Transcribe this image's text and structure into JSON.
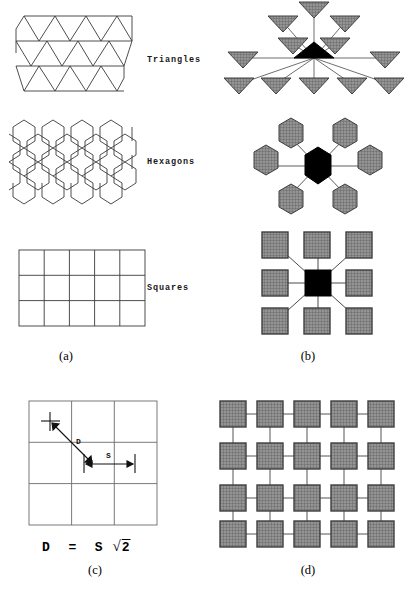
{
  "figure": {
    "kind": "tessellation-neighborhood-diagram",
    "panels": [
      {
        "id": "a",
        "caption": "(a)",
        "description": "tessellation tilings"
      },
      {
        "id": "b",
        "caption": "(b)",
        "description": "cell neighborhoods"
      },
      {
        "id": "c",
        "caption": "(c)",
        "description": "diagonal distance in square grid"
      },
      {
        "id": "d",
        "caption": "(d)",
        "description": "square lattice connectivity"
      }
    ]
  },
  "tilings": {
    "triangles": {
      "label": "Triangles",
      "cols": 4,
      "rows": 3,
      "cell_width": 31,
      "cell_height": 25
    },
    "hexagons": {
      "label": "Hexagons",
      "cols": 4,
      "rows": 3,
      "cell_width": 29,
      "cell_height": 28
    },
    "squares": {
      "label": "Squares",
      "cols": 5,
      "rows": 3,
      "cell_width": 25,
      "cell_height": 25
    }
  },
  "neighborhoods": {
    "triangles": {
      "center_shape": "triangle-up",
      "center_fill": "#000000",
      "neighbor_shape": "triangle-down",
      "neighbor_fill": "#8a8a8a",
      "neighbor_count": 12
    },
    "hexagons": {
      "center_shape": "hexagon",
      "center_fill": "#000000",
      "neighbor_shape": "hexagon",
      "neighbor_fill": "#8a8a8a",
      "neighbor_count": 6
    },
    "squares": {
      "center_shape": "square",
      "center_fill": "#000000",
      "neighbor_shape": "square",
      "neighbor_fill": "#8a8a8a",
      "neighbor_count": 8
    }
  },
  "distance_panel": {
    "grid_cols": 3,
    "grid_rows": 3,
    "diagonal_label": "D",
    "side_label": "S",
    "formula_d": "D",
    "formula_eq": "=",
    "formula_s": "S",
    "formula_root": "2",
    "caption": "(c)"
  },
  "lattice_panel": {
    "cols": 5,
    "rows": 4,
    "cell_fill": "#8a8a8a",
    "connector_color": "#555555",
    "caption": "(d)"
  },
  "colors": {
    "line": "#3a3a3a",
    "black_cell": "#000000",
    "gray_cell": "#8a8a8a",
    "gray_cell_border": "#4a4a4a",
    "background": "#ffffff"
  }
}
